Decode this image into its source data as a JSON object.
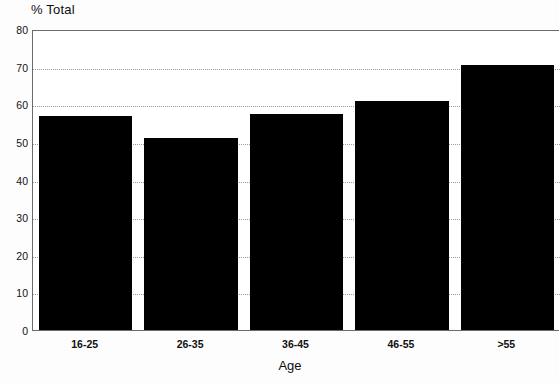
{
  "chart_data": {
    "type": "bar",
    "title": "% Total",
    "xlabel": "Age",
    "ylabel": "",
    "categories": [
      "16-25",
      "26-35",
      "36-45",
      "46-55",
      ">55"
    ],
    "values": [
      57,
      51,
      57.5,
      61,
      70.5
    ],
    "ylim": [
      0,
      80
    ],
    "ytick_labels": [
      "0",
      "10",
      "20",
      "30",
      "40",
      "50",
      "60",
      "70",
      "80"
    ],
    "ytick_values": [
      0,
      10,
      20,
      30,
      40,
      50,
      60,
      70,
      80
    ],
    "grid": true,
    "grid_style": "dotted",
    "legend": null,
    "bar_color": "#000000",
    "axis_color": "#6b6b6b",
    "grid_color": "#9a9a9a",
    "note": "last bar is cropped at right edge of image"
  }
}
